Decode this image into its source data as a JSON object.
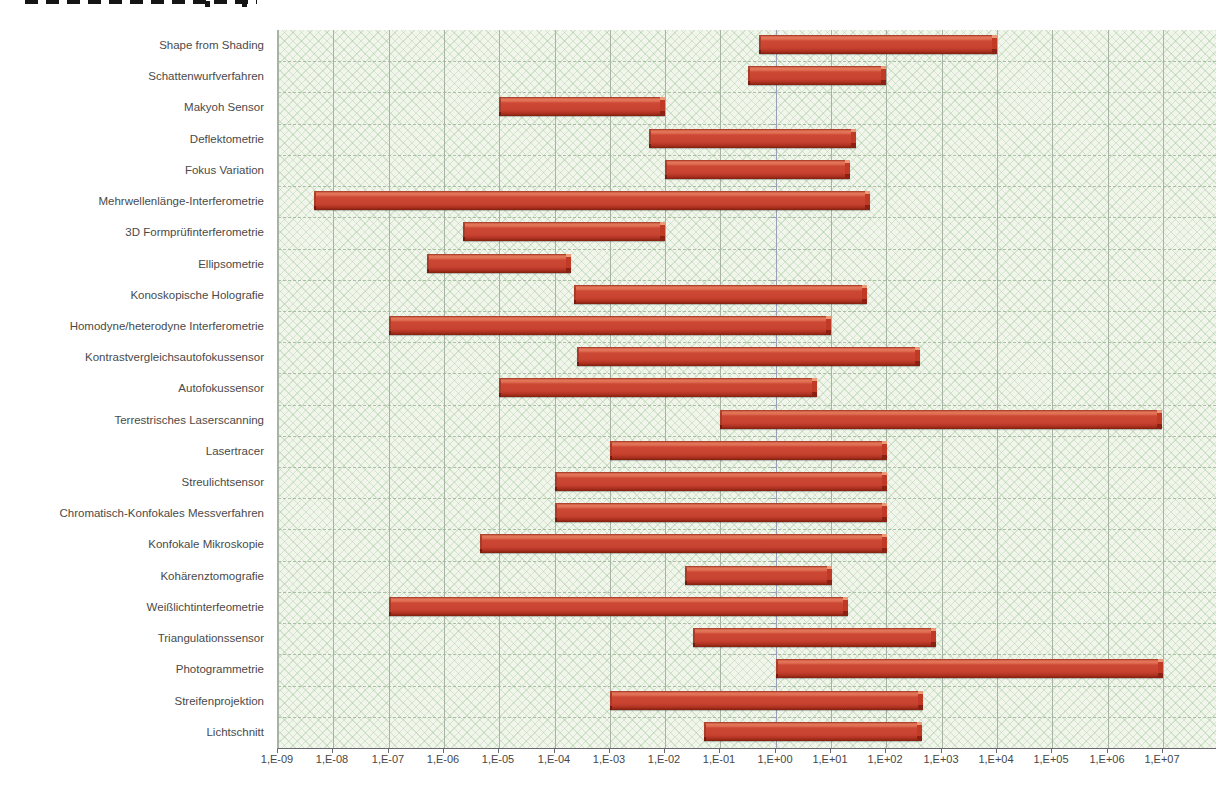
{
  "page": {
    "cropped_heading_visible": true,
    "cropped_heading_legible": false
  },
  "colors": {
    "bar_face": "#c74230",
    "bar_highlight": "#e4765a",
    "bar_shadow": "#80200f",
    "plot_background": "#f1f5ec",
    "hatch_pattern": "#8ebc84",
    "gridline": "#a7b3a5",
    "row_separator": "#9fb79b",
    "axis_line": "#67676f",
    "value_axis_line_at_1E00": "#99a0b5",
    "label_text": "#4a4a4a"
  },
  "chart_data": {
    "type": "bar",
    "subtype": "horizontal-floating-range",
    "x_scale": "log10",
    "title": "",
    "xlabel": "",
    "ylabel": "",
    "legend": "none",
    "grid": {
      "vertical_decade_gridlines": true,
      "horizontal_row_separators": "dashed"
    },
    "x_range_log10": [
      -9,
      7.95
    ],
    "axis_crosses_at": "1,E+00",
    "x_tick_labels": [
      "1,E-09",
      "1,E-08",
      "1,E-07",
      "1,E-06",
      "1,E-05",
      "1,E-04",
      "1,E-03",
      "1,E-02",
      "1,E-01",
      "1,E+00",
      "1,E+01",
      "1,E+02",
      "1,E+03",
      "1,E+04",
      "1,E+05",
      "1,E+06",
      "1,E+07"
    ],
    "series": [
      {
        "label": "Shape from Shading",
        "range_min": "5E-01",
        "range_max": "1E+04",
        "log10_min": -0.3,
        "log10_max": 4.0
      },
      {
        "label": "Schattenwurfverfahren",
        "range_min": "3E-01",
        "range_max": "1E+02",
        "log10_min": -0.5,
        "log10_max": 2.0
      },
      {
        "label": "Makyoh Sensor",
        "range_min": "1E-05",
        "range_max": "1E-02",
        "log10_min": -5.0,
        "log10_max": -2.0
      },
      {
        "label": "Deflektometrie",
        "range_min": "5E-03",
        "range_max": "3E+01",
        "log10_min": -2.3,
        "log10_max": 1.45
      },
      {
        "label": "Fokus Variation",
        "range_min": "1E-02",
        "range_max": "2E+01",
        "log10_min": -2.0,
        "log10_max": 1.35
      },
      {
        "label": "Mehrwellenlänge-Interferometrie",
        "range_min": "5E-09",
        "range_max": "5E+01",
        "log10_min": -8.35,
        "log10_max": 1.7
      },
      {
        "label": "3D Formprüfinterferometrie",
        "range_min": "2E-06",
        "range_max": "1E-02",
        "log10_min": -5.65,
        "log10_max": -2.0
      },
      {
        "label": "Ellipsometrie",
        "range_min": "5E-07",
        "range_max": "2E-04",
        "log10_min": -6.3,
        "log10_max": -3.7
      },
      {
        "label": "Konoskopische Holografie",
        "range_min": "2E-04",
        "range_max": "5E+01",
        "log10_min": -3.65,
        "log10_max": 1.65
      },
      {
        "label": "Homodyne/heterodyne Interferometrie",
        "range_min": "1E-07",
        "range_max": "1E+01",
        "log10_min": -7.0,
        "log10_max": 1.0
      },
      {
        "label": "Kontrastvergleichsautofokussensor",
        "range_min": "2E-04",
        "range_max": "4E+02",
        "log10_min": -3.6,
        "log10_max": 2.6
      },
      {
        "label": "Autofokussensor",
        "range_min": "1E-05",
        "range_max": "5E+00",
        "log10_min": -5.0,
        "log10_max": 0.75
      },
      {
        "label": "Terrestrisches Laserscanning",
        "range_min": "1E-01",
        "range_max": "1E+07",
        "log10_min": -1.0,
        "log10_max": 7.0
      },
      {
        "label": "Lasertracer",
        "range_min": "1E-03",
        "range_max": "1E+02",
        "log10_min": -3.0,
        "log10_max": 2.0
      },
      {
        "label": "Streulichtsensor",
        "range_min": "1E-04",
        "range_max": "1E+02",
        "log10_min": -4.0,
        "log10_max": 2.0
      },
      {
        "label": "Chromatisch-Konfokales Messverfahren",
        "range_min": "1E-04",
        "range_max": "1E+02",
        "log10_min": -4.0,
        "log10_max": 2.0
      },
      {
        "label": "Konfokale Mikroskopie",
        "range_min": "5E-06",
        "range_max": "1E+02",
        "log10_min": -5.35,
        "log10_max": 2.0
      },
      {
        "label": "Kohärenztomografie",
        "range_min": "2E-02",
        "range_max": "1E+01",
        "log10_min": -1.65,
        "log10_max": 1.0
      },
      {
        "label": "Weißlichtinterfeometrie",
        "range_min": "1E-07",
        "range_max": "2E+01",
        "log10_min": -7.0,
        "log10_max": 1.3
      },
      {
        "label": "Triangulationssensor",
        "range_min": "3E-02",
        "range_max": "8E+02",
        "log10_min": -1.5,
        "log10_max": 2.9
      },
      {
        "label": "Photogrammetrie",
        "range_min": "1E+00",
        "range_max": "1E+07",
        "log10_min": 0.0,
        "log10_max": 7.0
      },
      {
        "label": "Streifenprojektion",
        "range_min": "1E-03",
        "range_max": "5E+02",
        "log10_min": -3.0,
        "log10_max": 2.65
      },
      {
        "label": "Lichtschnitt",
        "range_min": "5E-02",
        "range_max": "5E+02",
        "log10_min": -1.3,
        "log10_max": 2.65
      }
    ]
  }
}
